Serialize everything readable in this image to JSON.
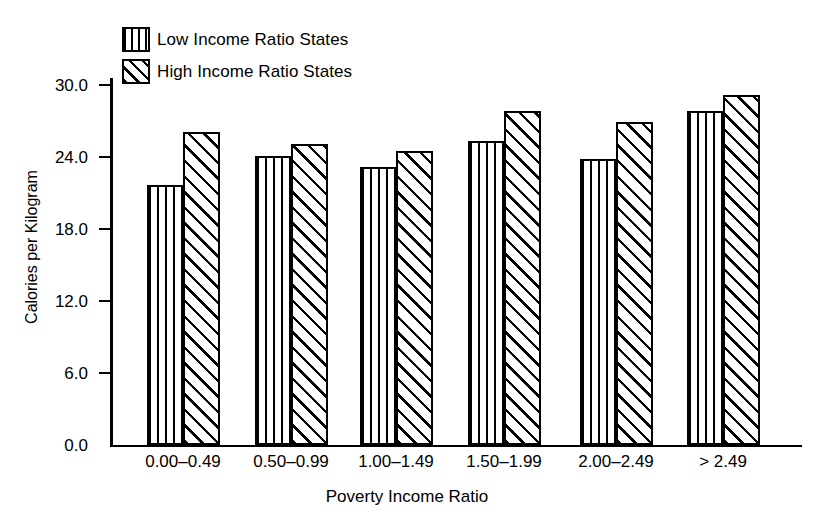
{
  "chart_data": {
    "type": "bar",
    "title": "",
    "xlabel": "Poverty Income Ratio",
    "ylabel": "Calories per Kilogram",
    "categories": [
      "0.00–0.49",
      "0.50–0.99",
      "1.00–1.49",
      "1.50–1.99",
      "2.00–2.49",
      "> 2.49"
    ],
    "series": [
      {
        "name": "Low Income Ratio States",
        "pattern": "vertical-hatch",
        "values": [
          21.7,
          24.1,
          23.2,
          25.3,
          23.8,
          27.8
        ]
      },
      {
        "name": "High Income Ratio States",
        "pattern": "diagonal-hatch",
        "values": [
          26.1,
          25.1,
          24.5,
          27.8,
          26.9,
          29.2
        ]
      }
    ],
    "ylim": [
      0.0,
      30.0
    ],
    "yticks": [
      0.0,
      6.0,
      12.0,
      18.0,
      24.0,
      30.0
    ],
    "ytick_labels": [
      "0.0",
      "6.0",
      "12.0",
      "18.0",
      "24.0",
      "30.0"
    ],
    "grid": false,
    "legend_position": "top-left",
    "colors": {
      "ink": "#000000",
      "background": "#ffffff"
    }
  },
  "legend": {
    "entries": [
      {
        "label": "Low Income Ratio States",
        "swatch": "vertical-hatch-swatch"
      },
      {
        "label": "High Income Ratio States",
        "swatch": "diagonal-hatch-swatch"
      }
    ]
  },
  "axes": {
    "y_title": "Calories per Kilogram",
    "x_title": "Poverty Income Ratio"
  }
}
